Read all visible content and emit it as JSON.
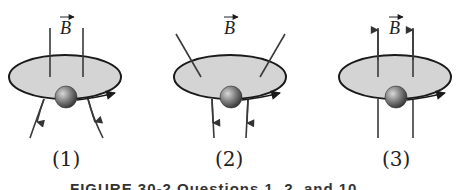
{
  "figure": {
    "panels": [
      {
        "id": 1,
        "label": "(1)",
        "field_label": "B",
        "field_configuration": "diverging downward (field lines spread out below loop, arrows pointing down)"
      },
      {
        "id": 2,
        "label": "(2)",
        "field_label": "B",
        "field_configuration": "converging downward (field lines slanted inward from above, straight down below)"
      },
      {
        "id": 3,
        "label": "(3)",
        "field_label": "B",
        "field_configuration": "uniform upward (parallel field lines, arrows pointing up)"
      }
    ],
    "caption_partial": "FIGURE 30-2  Questions 1, 2, and 10.",
    "colors": {
      "loop_fill": "#d4d4d4",
      "loop_stroke": "#1a1a1a",
      "field_line": "#3a3a3a",
      "ball_highlight": "#cfcfcf",
      "ball_shadow": "#3c3c3c"
    }
  }
}
